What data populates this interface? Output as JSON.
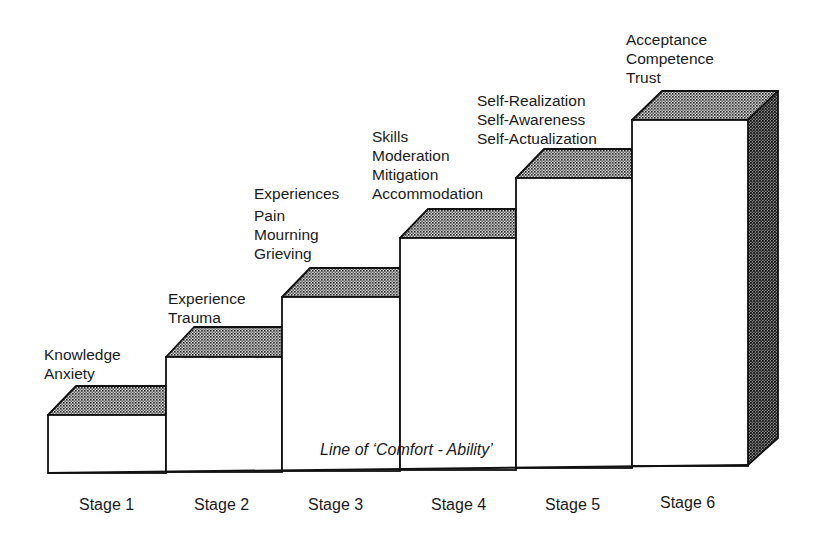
{
  "diagram": {
    "type": "staircase",
    "baseline_label": "Line of ‘Comfort - Ability’",
    "stages": [
      {
        "name": "Stage 1",
        "lines": [
          "Knowledge",
          "Anxiety"
        ]
      },
      {
        "name": "Stage 2",
        "lines": [
          "Experience",
          "Trauma"
        ]
      },
      {
        "name": "Stage 3",
        "lines": [
          "Experiences",
          "Pain",
          "Mourning",
          "Grieving"
        ]
      },
      {
        "name": "Stage 4",
        "lines": [
          "Skills",
          "Moderation",
          "Mitigation",
          "Accommodation"
        ]
      },
      {
        "name": "Stage 5",
        "lines": [
          "Self-Realization",
          "Self-Awareness",
          "Self-Actualization"
        ]
      },
      {
        "name": "Stage 6",
        "lines": [
          "Acceptance",
          "Competence",
          "Trust"
        ]
      }
    ],
    "colors": {
      "outline": "#111111",
      "top_face": "#9a9a9a",
      "side_face": "#6a6a6a",
      "front_face": "#ffffff"
    }
  }
}
